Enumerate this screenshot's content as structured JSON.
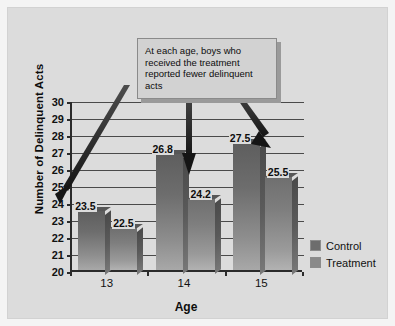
{
  "chart_data": {
    "type": "bar",
    "title": "",
    "xlabel": "Age",
    "ylabel": "Number of Delinquent Acts",
    "categories": [
      "13",
      "14",
      "15"
    ],
    "series": [
      {
        "name": "Control",
        "values": [
          23.5,
          26.8,
          27.5
        ],
        "color": "#6d6d6d"
      },
      {
        "name": "Treatment",
        "values": [
          22.5,
          24.2,
          25.5
        ],
        "color": "#8a8a8a"
      }
    ],
    "value_labels": [
      "23.5",
      "22.5",
      "26.8",
      "24.2",
      "27.5",
      "25.5"
    ],
    "ylim": [
      20,
      30
    ],
    "ytick_labels": [
      "30",
      "29",
      "28",
      "27",
      "26",
      "25",
      "24",
      "23",
      "22",
      "21",
      "20"
    ],
    "ytick_step": 1,
    "grid": true,
    "legend_position": "right",
    "annotation": "At each age, boys who received the treatment reported fewer delinquent acts",
    "annotation_arrow_count": 3
  },
  "legend": {
    "items": [
      {
        "label": "Control"
      },
      {
        "label": "Treatment"
      }
    ]
  },
  "callout": {
    "text": "At each age, boys who received the treatment reported fewer delinquent acts"
  },
  "colors": {
    "background": "#dcdcdc",
    "control": "#6d6d6d",
    "treatment": "#8a8a8a",
    "axis": "#2b2b2b",
    "grid": "#4a4a4a",
    "callout_bg": "#d2d2d2"
  }
}
